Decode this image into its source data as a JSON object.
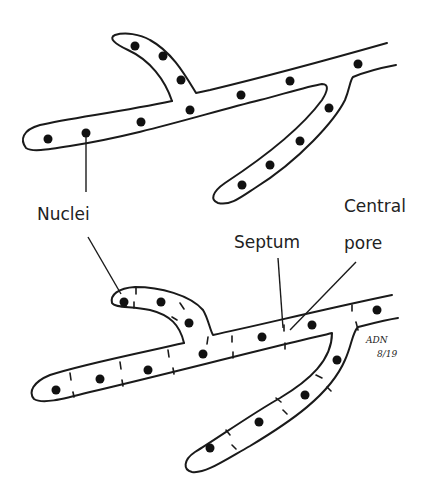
{
  "figure": {
    "top_panel": {
      "description": "Coenocytic hypha without septa",
      "nuclei_count": 13
    },
    "bottom_panel": {
      "description": "Septate hypha with cross-walls and central pores",
      "nuclei_count": 16
    },
    "labels": {
      "nuclei": "Nuclei",
      "central": "Central",
      "pore": "pore",
      "septum": "Septum"
    },
    "signature": {
      "initials": "ADN",
      "date": "8/19"
    }
  }
}
